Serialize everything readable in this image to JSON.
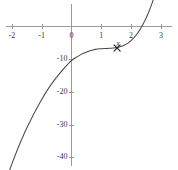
{
  "chart_data": {
    "type": "line",
    "title": "",
    "subtitle": "",
    "xlabel": "",
    "ylabel": "",
    "xlim": [
      -2.2,
      3.15
    ],
    "ylim": [
      -43.5,
      4.5
    ],
    "grid": false,
    "legend": null,
    "axis_style": "cartesian-crossing-axes",
    "x_ticks": [
      {
        "value": -2,
        "label": "-2"
      },
      {
        "value": -1,
        "label": "-1"
      },
      {
        "value": 0,
        "label": "0"
      },
      {
        "value": 1,
        "label": "1"
      },
      {
        "value": 2,
        "label": "2"
      },
      {
        "value": 3,
        "label": "3"
      }
    ],
    "y_ticks": [
      {
        "value": -10,
        "label": "-10"
      },
      {
        "value": -20,
        "label": "-20"
      },
      {
        "value": -30,
        "label": "-30"
      },
      {
        "value": -40,
        "label": "-40"
      }
    ],
    "series": [
      {
        "name": "curve",
        "color": "#4a4a4a",
        "style": "solid",
        "description": "increasing cubic-like curve with inflection near x=0.8",
        "x": [
          -2.2,
          -2.0,
          -1.8,
          -1.6,
          -1.4,
          -1.2,
          -1.0,
          -0.8,
          -0.6,
          -0.4,
          -0.2,
          0.0,
          0.2,
          0.4,
          0.6,
          0.8,
          1.0,
          1.2,
          1.4,
          1.6,
          1.8,
          2.0,
          2.2,
          2.4,
          2.6,
          2.8,
          2.95
        ],
        "y": [
          -47.0,
          -42.0,
          -37.3,
          -33.0,
          -29.2,
          -25.6,
          -22.3,
          -19.3,
          -16.7,
          -14.4,
          -12.3,
          -10.4,
          -9.2,
          -8.2,
          -7.5,
          -7.0,
          -6.8,
          -6.7,
          -6.6,
          -6.3,
          -5.6,
          -4.3,
          -2.3,
          0.7,
          4.6,
          9.6,
          13.2
        ]
      }
    ],
    "annotations": [
      {
        "type": "marker",
        "glyph": "x-cross",
        "label": "x",
        "x": 1.53,
        "y": -6.6,
        "color": "#1c1c1c"
      }
    ]
  },
  "figure": {
    "background_color": "#ffffff",
    "axis_color": "#9a9a9a",
    "curve_color": "#4a4a4a",
    "label_color": "#3a3a3a"
  }
}
